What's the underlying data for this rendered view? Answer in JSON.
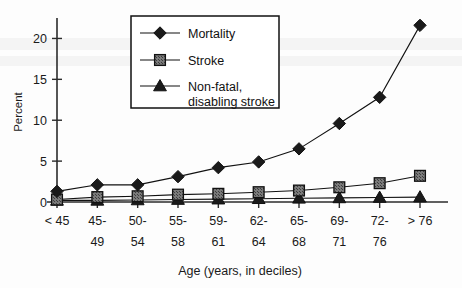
{
  "chart_data": {
    "type": "line",
    "title": "",
    "xlabel": "Age (years, in deciles)",
    "ylabel": "Percent",
    "ylim": [
      0,
      22.5
    ],
    "yticks": [
      0,
      5,
      10,
      15,
      20
    ],
    "grid": false,
    "legend_position": "top-center",
    "categories": [
      "< 45",
      "45-49",
      "50-54",
      "55-58",
      "59-61",
      "62-64",
      "65-68",
      "69-71",
      "72-76",
      "> 76"
    ],
    "category_lines": [
      [
        "< 45",
        ""
      ],
      [
        "45-",
        "49"
      ],
      [
        "50-",
        "54"
      ],
      [
        "55-",
        "58"
      ],
      [
        "59-",
        "61"
      ],
      [
        "62-",
        "64"
      ],
      [
        "65-",
        "68"
      ],
      [
        "69-",
        "71"
      ],
      [
        "72-",
        "76"
      ],
      [
        "> 76",
        ""
      ]
    ],
    "series": [
      {
        "name": "Mortality",
        "marker": "diamond",
        "color": "#1a1a1a",
        "values": [
          1.3,
          2.1,
          2.1,
          3.1,
          4.2,
          4.9,
          6.5,
          9.6,
          12.8,
          21.6
        ]
      },
      {
        "name": "Stroke",
        "marker": "square",
        "color": "#6e6e6e",
        "values": [
          0.3,
          0.6,
          0.7,
          0.9,
          1.0,
          1.2,
          1.4,
          1.8,
          2.3,
          3.2
        ]
      },
      {
        "name": "Non-fatal, disabling stroke",
        "marker": "triangle",
        "color": "#1a1a1a",
        "values": [
          0.2,
          0.2,
          0.25,
          0.3,
          0.35,
          0.4,
          0.45,
          0.5,
          0.55,
          0.6
        ]
      }
    ]
  },
  "legend": {
    "entries": [
      {
        "label": "Mortality",
        "label_line2": ""
      },
      {
        "label": "Stroke",
        "label_line2": ""
      },
      {
        "label": "Non-fatal,",
        "label_line2": "disabling stroke"
      }
    ]
  },
  "axis": {
    "y_title": "Percent",
    "x_title": "Age (years, in deciles)",
    "ytick_labels": [
      "0",
      "5",
      "10",
      "15",
      "20"
    ]
  },
  "colors": {
    "axis": "#2b2b2b",
    "line": "#111111",
    "marker_dark": "#1a1a1a",
    "marker_gray": "#6e6e6e",
    "background": "#fdfdfd"
  }
}
